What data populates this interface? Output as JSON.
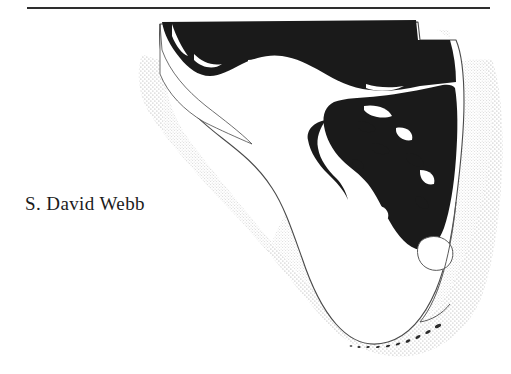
{
  "page": {
    "background_color": "#ffffff",
    "kind": "scanned-book-page"
  },
  "header": {
    "rule": {
      "label": "horizontal-rule",
      "color": "#2e2e2e"
    }
  },
  "byline": {
    "text": "S. David Webb"
  },
  "figure": {
    "legend": [
      {
        "key": "shaded-region",
        "label": "Shaded distribution area",
        "color": "#1a1a1a"
      },
      {
        "key": "emergent-land",
        "label": "Modern emergent land",
        "color": "#ffffff"
      },
      {
        "key": "continental-shelf",
        "label": "Submerged continental shelf (stippled)",
        "color": "#c9c9c9"
      },
      {
        "key": "coastline",
        "label": "Coastline outline",
        "color": "#5a5a5a"
      }
    ],
    "features": [
      {
        "key": "panhandle",
        "label": "Florida panhandle"
      },
      {
        "key": "peninsula",
        "label": "Florida peninsula"
      },
      {
        "key": "lake-okeechobee",
        "label": "Lake Okeechobee"
      },
      {
        "key": "florida-keys",
        "label": "Florida Keys"
      },
      {
        "key": "gulf-of-mexico",
        "label": "Gulf of Mexico shelf"
      },
      {
        "key": "atlantic-shelf",
        "label": "Atlantic shelf"
      }
    ]
  }
}
